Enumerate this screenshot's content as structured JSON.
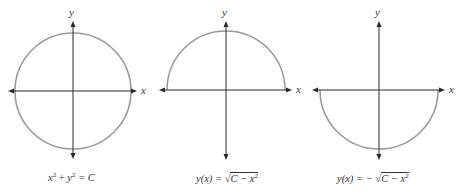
{
  "panels": [
    {
      "id": "circle",
      "x_label": "x",
      "y_label": "y",
      "caption": {
        "lhs": "x",
        "exp1": "2",
        "plus": " + ",
        "mid": "y",
        "exp2": "2",
        "rhs": " = C"
      },
      "curve": "full circle",
      "curve_color": "#9a9a9a"
    },
    {
      "id": "upper-semicircle",
      "x_label": "x",
      "y_label": "y",
      "caption": {
        "lhs": "y(x) = ",
        "sqrt": "√",
        "radicand": "C − x",
        "exp": "2"
      },
      "curve": "upper semicircle",
      "curve_color": "#9a9a9a"
    },
    {
      "id": "lower-semicircle",
      "x_label": "x",
      "y_label": "y",
      "caption": {
        "lhs": "y(x) = − ",
        "sqrt": "√",
        "radicand": "C − x",
        "exp": "2"
      },
      "curve": "lower semicircle",
      "curve_color": "#9a9a9a"
    }
  ]
}
